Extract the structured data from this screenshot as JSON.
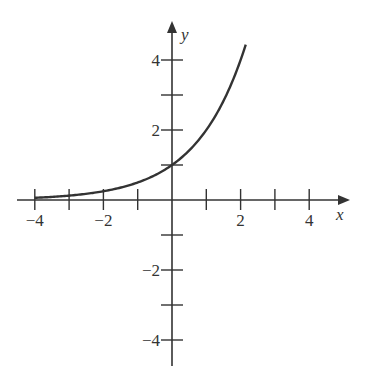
{
  "chart_data": {
    "type": "line",
    "title": "",
    "function": "y = 2^x",
    "xlabel": "x",
    "ylabel": "y",
    "xlim": [
      -4.6,
      5.1
    ],
    "ylim": [
      -4.7,
      5.1
    ],
    "grid": false,
    "x_ticks": [
      -4,
      -3,
      -2,
      -1,
      1,
      2,
      3,
      4
    ],
    "y_ticks": [
      -4,
      -3,
      -2,
      -1,
      1,
      2,
      3,
      4
    ],
    "x_tick_labels": [
      {
        "value": -4,
        "text": "−4"
      },
      {
        "value": -2,
        "text": "−2"
      },
      {
        "value": 2,
        "text": "2"
      },
      {
        "value": 4,
        "text": "4"
      }
    ],
    "y_tick_labels": [
      {
        "value": 4,
        "text": "4"
      },
      {
        "value": 2,
        "text": "2"
      },
      {
        "value": -2,
        "text": "−2"
      },
      {
        "value": -4,
        "text": "−4"
      }
    ],
    "series": [
      {
        "name": "exponential curve",
        "x": [
          -4,
          -3.5,
          -3,
          -2.5,
          -2,
          -1.5,
          -1,
          -0.5,
          0,
          0.5,
          1,
          1.5,
          2,
          2.15
        ],
        "y": [
          0.0625,
          0.088,
          0.125,
          0.177,
          0.25,
          0.354,
          0.5,
          0.707,
          1,
          1.414,
          2,
          2.828,
          4,
          4.44
        ]
      }
    ],
    "colors": {
      "axis": "#333333",
      "curve": "#333333",
      "background": "#ffffff"
    }
  }
}
